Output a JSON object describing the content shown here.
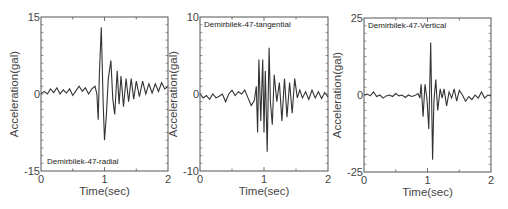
{
  "chart_data": [
    {
      "type": "line",
      "title": "Demirbilek-47-radial",
      "label_position": "bottom-left",
      "xlabel": "Time(sec)",
      "ylabel": "Acceleration(gal)",
      "xlim": [
        0,
        2
      ],
      "ylim": [
        -15,
        15
      ],
      "xticks": [
        "0",
        "1",
        "2"
      ],
      "yticks": [
        "-15",
        "0",
        "15"
      ],
      "box": {
        "x0": 41,
        "y0": 17,
        "x1": 168,
        "y1": 171
      },
      "series": [
        {
          "name": "radial",
          "x": [
            0,
            0.05,
            0.1,
            0.15,
            0.2,
            0.25,
            0.3,
            0.35,
            0.4,
            0.45,
            0.5,
            0.55,
            0.6,
            0.65,
            0.7,
            0.75,
            0.8,
            0.85,
            0.88,
            0.9,
            0.92,
            0.95,
            0.98,
            1.0,
            1.03,
            1.06,
            1.1,
            1.13,
            1.16,
            1.2,
            1.23,
            1.26,
            1.3,
            1.34,
            1.38,
            1.42,
            1.46,
            1.5,
            1.55,
            1.6,
            1.65,
            1.7,
            1.75,
            1.8,
            1.85,
            1.9,
            1.95,
            2.0
          ],
          "y": [
            0,
            0.5,
            0,
            1,
            0.3,
            1.2,
            0,
            0.8,
            0.2,
            1,
            -0.3,
            0.6,
            1.5,
            0.5,
            1.2,
            0,
            1,
            1.5,
            0,
            -5,
            4,
            13,
            -2,
            -9,
            -4,
            3,
            6.5,
            -1,
            -4,
            4.5,
            -2,
            3.5,
            -2.5,
            3,
            -1.5,
            3,
            -1,
            2.5,
            -0.5,
            2.5,
            0,
            2,
            0.2,
            2,
            0.5,
            2.2,
            1,
            1.5
          ]
        }
      ]
    },
    {
      "type": "line",
      "title": "Demirbilek-47-tangential",
      "label_position": "top-left",
      "xlabel": "Time(sec)",
      "ylabel": "Acceleration(gal)",
      "xlim": [
        0,
        2
      ],
      "ylim": [
        -10,
        10
      ],
      "xticks": [
        "0",
        "1",
        "2"
      ],
      "yticks": [
        "-10",
        "0",
        "10"
      ],
      "box": {
        "x0": 200,
        "y0": 17,
        "x1": 328,
        "y1": 171
      },
      "series": [
        {
          "name": "tangential",
          "x": [
            0,
            0.05,
            0.1,
            0.15,
            0.2,
            0.25,
            0.3,
            0.35,
            0.4,
            0.45,
            0.5,
            0.55,
            0.6,
            0.65,
            0.7,
            0.75,
            0.8,
            0.85,
            0.88,
            0.9,
            0.92,
            0.95,
            0.98,
            1.0,
            1.02,
            1.05,
            1.08,
            1.1,
            1.13,
            1.16,
            1.2,
            1.24,
            1.28,
            1.32,
            1.36,
            1.4,
            1.44,
            1.48,
            1.52,
            1.56,
            1.6,
            1.65,
            1.7,
            1.75,
            1.8,
            1.85,
            1.9,
            1.95,
            2.0
          ],
          "y": [
            0,
            -0.5,
            -0.2,
            -0.7,
            0,
            -0.5,
            -0.3,
            0,
            -1,
            0,
            0.5,
            -0.2,
            0.3,
            0,
            0.5,
            -0.5,
            -1.5,
            -0.8,
            1,
            -5,
            4.5,
            -3.5,
            4.5,
            -5,
            3,
            -7.5,
            6,
            -1,
            -4,
            2.5,
            -1,
            1.5,
            -3.5,
            2,
            -3,
            1.5,
            -2.5,
            2,
            -0.5,
            0.5,
            -0.5,
            0.3,
            -0.7,
            0.5,
            -0.5,
            0.3,
            -0.6,
            0.2,
            -0.4
          ]
        }
      ]
    },
    {
      "type": "line",
      "title": "Demirbilek-47-Vertical",
      "label_position": "top-left",
      "xlabel": "Time(sec)",
      "ylabel": "Acceleration(gal)",
      "xlim": [
        0,
        2
      ],
      "ylim": [
        -25,
        25
      ],
      "xticks": [
        "0",
        "1",
        "2"
      ],
      "yticks": [
        "-25",
        "0",
        "25"
      ],
      "box": {
        "x0": 364,
        "y0": 18,
        "x1": 491,
        "y1": 172
      },
      "series": [
        {
          "name": "vertical",
          "x": [
            0,
            0.05,
            0.1,
            0.15,
            0.2,
            0.25,
            0.3,
            0.35,
            0.4,
            0.45,
            0.5,
            0.55,
            0.6,
            0.65,
            0.7,
            0.75,
            0.8,
            0.85,
            0.88,
            0.9,
            0.93,
            0.96,
            0.99,
            1.02,
            1.05,
            1.08,
            1.1,
            1.13,
            1.16,
            1.2,
            1.23,
            1.26,
            1.3,
            1.34,
            1.38,
            1.42,
            1.46,
            1.5,
            1.55,
            1.6,
            1.65,
            1.7,
            1.75,
            1.8,
            1.85,
            1.9,
            1.95,
            2.0
          ],
          "y": [
            0,
            0.3,
            -0.3,
            1,
            -0.5,
            0,
            -1,
            -0.3,
            0,
            -0.5,
            0.5,
            -0.3,
            0,
            -0.8,
            0,
            -0.5,
            -0.2,
            0.5,
            -1,
            3.5,
            -7,
            3.5,
            -1,
            -11,
            17,
            -21,
            -2,
            5,
            -5,
            2,
            -1,
            2,
            -3.5,
            1,
            -1,
            2,
            -2,
            1.5,
            0,
            -2,
            -0.5,
            -1.5,
            0,
            -1,
            1,
            -1,
            0,
            -0.3
          ]
        }
      ]
    }
  ],
  "figure": {
    "line_color": "#333333",
    "frame_color": "#555555",
    "background": "#ffffff"
  }
}
